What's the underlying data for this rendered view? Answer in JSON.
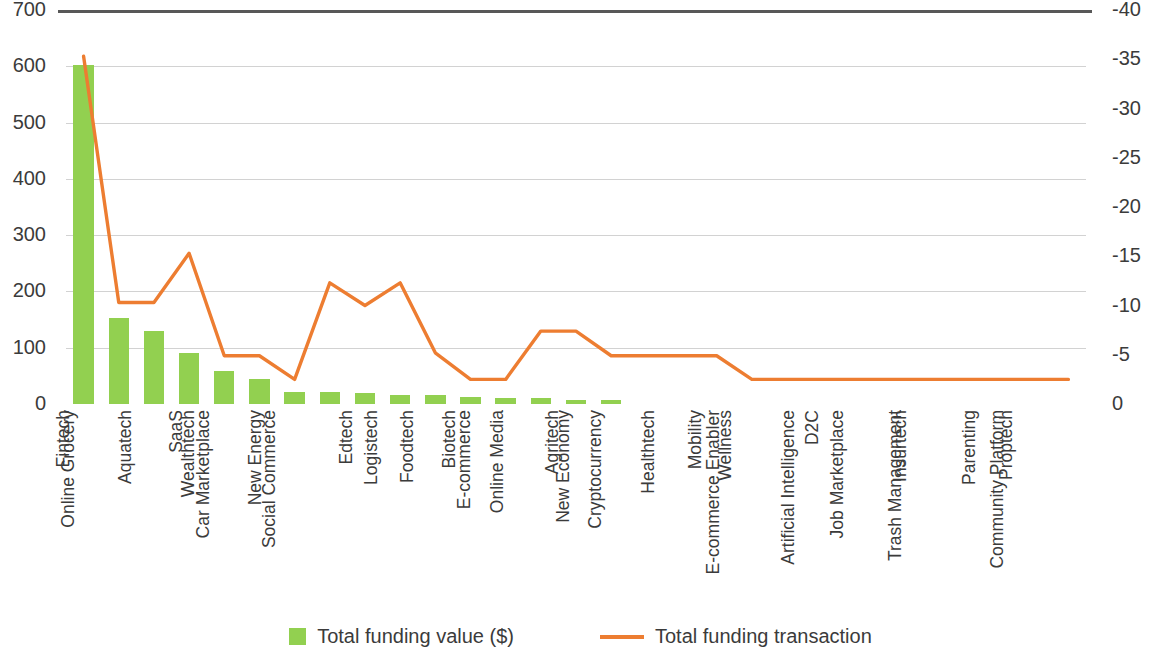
{
  "chart_data": {
    "type": "bar",
    "title": "",
    "subtitle": "",
    "xlabel": "",
    "ylabel": "",
    "y2label": "",
    "grid": true,
    "legend_position": "bottom",
    "categories": [
      "Fintech",
      "Online Grocery",
      "Aquatech",
      "SaaS",
      "Wealthtech",
      "Car Marketplace",
      "New Energy",
      "Social Commerce",
      "Edtech",
      "Logistech",
      "Foodtech",
      "Biotech",
      "E-commerce",
      "Online Media",
      "Agritech",
      "New Economy",
      "Cryptocurrency",
      "Healthtech",
      "Mobility",
      "Wellness",
      "E-commerce Enabler",
      "D2C",
      "Artificial Intelligence",
      "Job Marketplace",
      "Insurtech",
      "Trash Management",
      "Parenting",
      "Proptech",
      "Community Platform"
    ],
    "series": [
      {
        "name": "Total funding value ($)",
        "type": "bar",
        "axis": "left",
        "color": "#92d050",
        "values": [
          602,
          153,
          130,
          90,
          58,
          45,
          22,
          21,
          20,
          16,
          16,
          13,
          11,
          11,
          7,
          7,
          0,
          0,
          0,
          0,
          0,
          0,
          0,
          0,
          0,
          0,
          0,
          0,
          0
        ]
      },
      {
        "name": "Total funding transaction",
        "type": "line",
        "axis": "right",
        "color": "#ed7d31",
        "values": [
          35.3,
          10.3,
          10.3,
          15.3,
          4.9,
          4.9,
          2.5,
          12.3,
          10.0,
          12.3,
          5.2,
          2.5,
          2.5,
          7.4,
          7.4,
          4.9,
          4.9,
          4.9,
          4.9,
          2.5,
          2.5,
          2.5,
          2.5,
          2.5,
          2.5,
          2.5,
          2.5,
          2.5,
          2.5
        ]
      }
    ],
    "left_axis": {
      "ticks": [
        "0",
        "100",
        "200",
        "300",
        "400",
        "500",
        "600",
        "700"
      ],
      "min": 0,
      "max": 700
    },
    "right_axis": {
      "ticks": [
        "0",
        "-5",
        "-10",
        "-15",
        "-20",
        "-25",
        "-30",
        "-35",
        "-40"
      ],
      "min": 0,
      "max": 40
    }
  },
  "legend": {
    "items": [
      {
        "label": "Total funding value ($)",
        "marker": "square-swatch-icon",
        "color": "#92d050"
      },
      {
        "label": "Total funding transaction",
        "marker": "line-swatch-icon",
        "color": "#ed7d31"
      }
    ]
  }
}
